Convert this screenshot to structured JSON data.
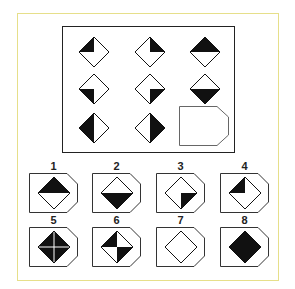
{
  "puzzle": {
    "matrix": {
      "cells": [
        {
          "row": 1,
          "col": 1,
          "fill": "top-left-quarter"
        },
        {
          "row": 1,
          "col": 2,
          "fill": "top-right-quarter"
        },
        {
          "row": 1,
          "col": 3,
          "fill": "top-half"
        },
        {
          "row": 2,
          "col": 1,
          "fill": "bottom-left-quarter"
        },
        {
          "row": 2,
          "col": 2,
          "fill": "bottom-right-quarter"
        },
        {
          "row": 2,
          "col": 3,
          "fill": "bottom-half"
        },
        {
          "row": 3,
          "col": 1,
          "fill": "left-half"
        },
        {
          "row": 3,
          "col": 2,
          "fill": "right-half"
        },
        {
          "row": 3,
          "col": 3,
          "fill": "missing"
        }
      ]
    },
    "options": [
      {
        "label": "1",
        "fill": "top-half"
      },
      {
        "label": "2",
        "fill": "bottom-half"
      },
      {
        "label": "3",
        "fill": "bottom-right-quarter"
      },
      {
        "label": "4",
        "fill": "top-left-quarter"
      },
      {
        "label": "5",
        "fill": "full-with-cross"
      },
      {
        "label": "6",
        "fill": "top-left-and-bottom-right-quarters"
      },
      {
        "label": "7",
        "fill": "empty"
      },
      {
        "label": "8",
        "fill": "full"
      }
    ],
    "colors": {
      "border": "#e6df8a",
      "ink": "#111111"
    }
  }
}
